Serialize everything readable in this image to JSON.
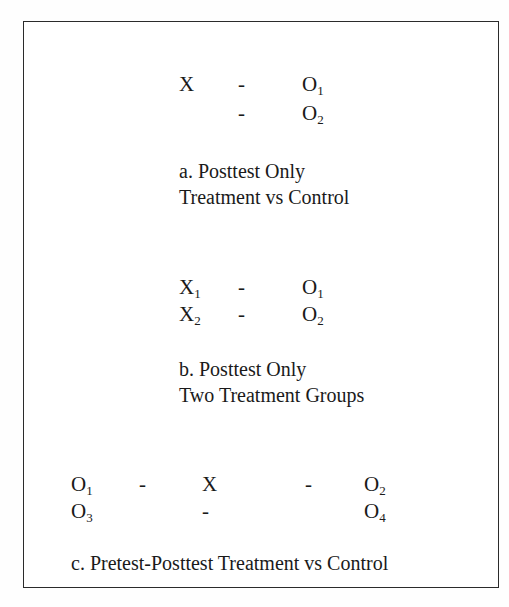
{
  "figure": {
    "frame": {
      "border_color": "#2b2b2b",
      "background_color": "#ffffff"
    },
    "panels": [
      {
        "id": "a",
        "rows": [
          {
            "cells": [
              "X",
              "-",
              "O1"
            ]
          },
          {
            "cells": [
              "",
              "-",
              "O2"
            ]
          }
        ],
        "caption_lines": [
          "a. Posttest Only",
          "Treatment vs Control"
        ]
      },
      {
        "id": "b",
        "rows": [
          {
            "cells": [
              "X1",
              "-",
              "O1"
            ]
          },
          {
            "cells": [
              "X2",
              "-",
              "O2"
            ]
          }
        ],
        "caption_lines": [
          "b. Posttest Only",
          "Two Treatment Groups"
        ]
      },
      {
        "id": "c",
        "rows": [
          {
            "cells": [
              "O1",
              "-",
              "X",
              "-",
              "O2"
            ]
          },
          {
            "cells": [
              "O3",
              "",
              "-",
              "",
              "O4"
            ]
          }
        ],
        "caption_lines": [
          "c. Pretest-Posttest Treatment vs Control"
        ]
      }
    ],
    "tokens": {
      "a_x": "X",
      "a_dash_1": "-",
      "a_o1_base": "O",
      "a_o1_sub": "1",
      "a_dash_2": "-",
      "a_o2_base": "O",
      "a_o2_sub": "2",
      "a_caption_1": "a. Posttest Only",
      "a_caption_2": "Treatment vs Control",
      "b_x1_base": "X",
      "b_x1_sub": "1",
      "b_dash_1": "-",
      "b_o1_base": "O",
      "b_o1_sub": "1",
      "b_x2_base": "X",
      "b_x2_sub": "2",
      "b_dash_2": "-",
      "b_o2_base": "O",
      "b_o2_sub": "2",
      "b_caption_1": "b. Posttest Only",
      "b_caption_2": "Two Treatment Groups",
      "c_o1_base": "O",
      "c_o1_sub": "1",
      "c_dash_1": "-",
      "c_x": "X",
      "c_dash_2": "-",
      "c_o2_base": "O",
      "c_o2_sub": "2",
      "c_o3_base": "O",
      "c_o3_sub": "3",
      "c_dash_3": "-",
      "c_o4_base": "O",
      "c_o4_sub": "4",
      "c_caption_1": "c. Pretest-Posttest Treatment vs Control"
    }
  }
}
